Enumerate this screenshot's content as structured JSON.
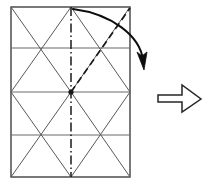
{
  "figure": {
    "title": "Origami crease pattern fold step",
    "canvas": {
      "width": 209,
      "height": 187
    },
    "colors": {
      "outline": "#404040",
      "crease": "#595959",
      "grid": "#6b6b6b",
      "fold_line": "#1a1a1a",
      "arrow": "#0d0d0d",
      "result_arrow_stroke": "#262626",
      "background": "#ffffff"
    },
    "paper": {
      "label": "paper-sheet",
      "left": 11,
      "top": 7,
      "right": 130,
      "bottom": 177,
      "horizontal_divisions": [
        7,
        48,
        92,
        135,
        177
      ],
      "vertical_center": 71
    },
    "creases": {
      "label": "x-crease-pattern",
      "segments": [
        {
          "name": "upper-left-x-a",
          "x1": 11,
          "y1": 7,
          "x2": 71,
          "y2": 92
        },
        {
          "name": "upper-left-x-b",
          "x1": 71,
          "y1": 7,
          "x2": 11,
          "y2": 92
        },
        {
          "name": "upper-right-x-a",
          "x1": 71,
          "y1": 7,
          "x2": 130,
          "y2": 92
        },
        {
          "name": "upper-right-x-b",
          "x1": 130,
          "y1": 7,
          "x2": 71,
          "y2": 92
        },
        {
          "name": "lower-left-x-a",
          "x1": 11,
          "y1": 92,
          "x2": 71,
          "y2": 177
        },
        {
          "name": "lower-left-x-b",
          "x1": 71,
          "y1": 92,
          "x2": 11,
          "y2": 177
        },
        {
          "name": "lower-right-x-a",
          "x1": 71,
          "y1": 92,
          "x2": 130,
          "y2": 177
        },
        {
          "name": "lower-right-x-b",
          "x1": 130,
          "y1": 92,
          "x2": 71,
          "y2": 177
        }
      ]
    },
    "center_fold": {
      "name": "vertical-center-dashdot-line",
      "x": 71,
      "y1": 7,
      "y2": 177,
      "style": "dash-dot"
    },
    "fold_line": {
      "name": "diagonal-fold-dashed-line",
      "x1": 71,
      "y1": 92,
      "x2": 130,
      "y2": 8,
      "style": "dashed"
    },
    "center_node": {
      "name": "center-vertex-dot",
      "x": 71,
      "y": 92,
      "r": 2.6
    },
    "motion_arrow": {
      "name": "fold-motion-curved-arrow",
      "start": [
        73,
        9
      ],
      "control1": [
        112,
        14
      ],
      "control2": [
        140,
        36
      ],
      "end": [
        143,
        60
      ],
      "head_tip": [
        144,
        68
      ]
    },
    "result_arrow": {
      "name": "next-step-block-arrow",
      "points": "158,95 182,95 182,85 201,99 182,112 182,102 158,102",
      "direction": "right"
    }
  }
}
